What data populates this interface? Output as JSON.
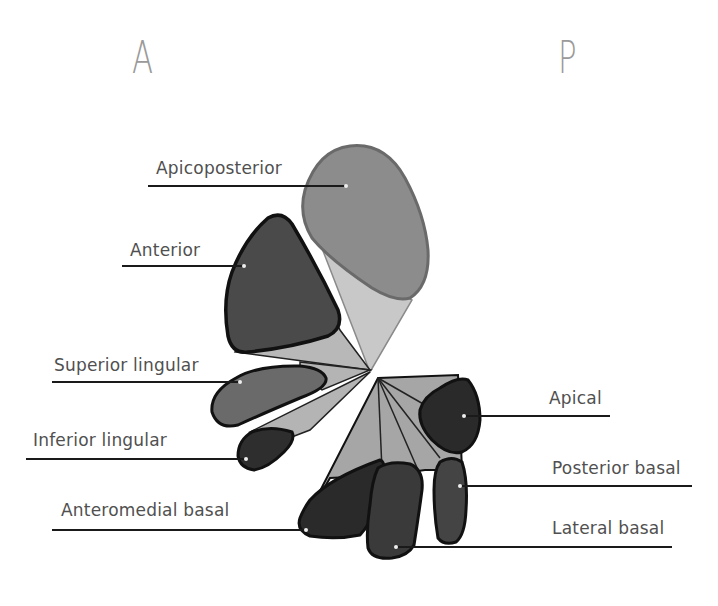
{
  "orientation": {
    "anterior": "A",
    "posterior": "P"
  },
  "colors": {
    "background": "#ffffff",
    "label_text": "#505050",
    "leader_line": "#1a1a1a",
    "apicoposterior_fill": "#8c8c8c",
    "apicoposterior_stem": "#c8c8c8",
    "anterior_fill": "#4a4a4a",
    "lingular_stem": "#b4b4b4",
    "superior_lingular_fill": "#6a6a6a",
    "inferior_lingular_fill": "#2e2e2e",
    "basal_stem": "#a6a6a6",
    "dark_segment_fill": "#2a2a2a",
    "outline": "#1a1a1a"
  },
  "segments": [
    {
      "id": "apicoposterior",
      "label": "Apicoposterior",
      "lobe": "upper"
    },
    {
      "id": "anterior",
      "label": "Anterior",
      "lobe": "upper"
    },
    {
      "id": "superior-lingular",
      "label": "Superior lingular",
      "lobe": "upper"
    },
    {
      "id": "inferior-lingular",
      "label": "Inferior lingular",
      "lobe": "upper"
    },
    {
      "id": "apical",
      "label": "Apical",
      "lobe": "lower"
    },
    {
      "id": "anteromedial-basal",
      "label": "Anteromedial basal",
      "lobe": "lower"
    },
    {
      "id": "posterior-basal",
      "label": "Posterior basal",
      "lobe": "lower"
    },
    {
      "id": "lateral-basal",
      "label": "Lateral basal",
      "lobe": "lower"
    }
  ]
}
